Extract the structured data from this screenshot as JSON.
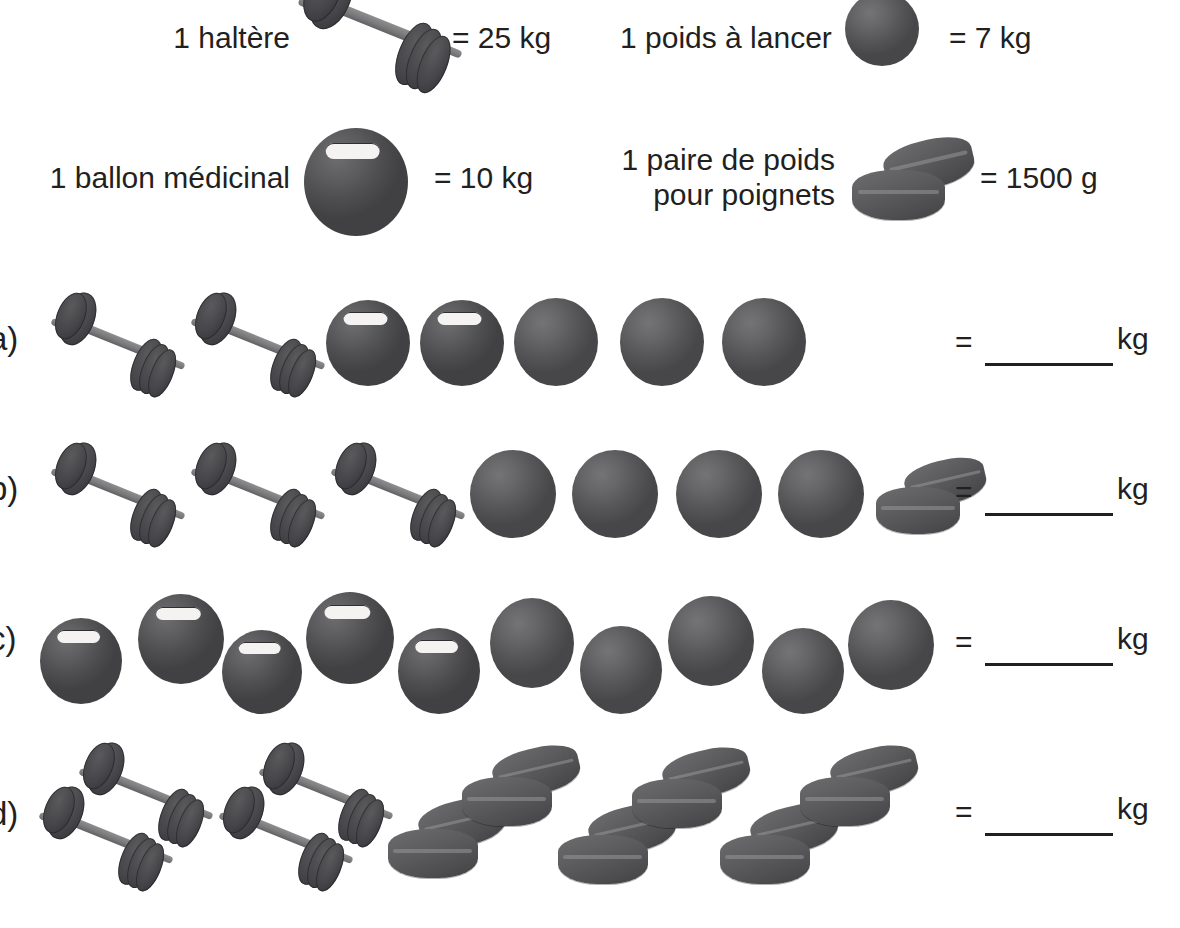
{
  "legend": {
    "items": [
      {
        "label": "1 haltère",
        "icon": "dumbbell-icon",
        "equals": "= 25 kg",
        "value": 25,
        "unit": "kg"
      },
      {
        "label": "1 poids à lancer",
        "icon": "shot-put-icon",
        "equals": "= 7 kg",
        "value": 7,
        "unit": "kg"
      },
      {
        "label": "1 ballon médicinal",
        "icon": "medicine-ball-icon",
        "equals": "= 10 kg",
        "value": 10,
        "unit": "kg"
      },
      {
        "label": "1 paire de poids\npour poignets",
        "icon": "wrist-weight-icon",
        "equals": "= 1500 g",
        "value": 1500,
        "unit": "g"
      }
    ]
  },
  "exercise": {
    "equals_sign": "=",
    "unit": "kg",
    "rows": [
      {
        "label": "a)",
        "items": [
          {
            "type": "dumbbell"
          },
          {
            "type": "dumbbell"
          },
          {
            "type": "medicine-ball"
          },
          {
            "type": "medicine-ball"
          },
          {
            "type": "shot-put"
          },
          {
            "type": "shot-put"
          },
          {
            "type": "shot-put"
          }
        ],
        "counts": {
          "dumbbell": 2,
          "medicine-ball": 2,
          "shot-put": 3,
          "wrist-weight": 0
        }
      },
      {
        "label": "b)",
        "items": [
          {
            "type": "dumbbell"
          },
          {
            "type": "dumbbell"
          },
          {
            "type": "dumbbell"
          },
          {
            "type": "shot-put"
          },
          {
            "type": "shot-put"
          },
          {
            "type": "shot-put"
          },
          {
            "type": "shot-put"
          },
          {
            "type": "wrist-weight"
          }
        ],
        "counts": {
          "dumbbell": 3,
          "medicine-ball": 0,
          "shot-put": 4,
          "wrist-weight": 1
        }
      },
      {
        "label": "c)",
        "items": [
          {
            "type": "medicine-ball"
          },
          {
            "type": "medicine-ball"
          },
          {
            "type": "medicine-ball"
          },
          {
            "type": "medicine-ball"
          },
          {
            "type": "medicine-ball"
          },
          {
            "type": "shot-put"
          },
          {
            "type": "shot-put"
          },
          {
            "type": "shot-put"
          },
          {
            "type": "shot-put"
          },
          {
            "type": "shot-put"
          }
        ],
        "counts": {
          "dumbbell": 0,
          "medicine-ball": 5,
          "shot-put": 5,
          "wrist-weight": 0
        }
      },
      {
        "label": "d)",
        "items": [
          {
            "type": "dumbbell"
          },
          {
            "type": "dumbbell"
          },
          {
            "type": "dumbbell"
          },
          {
            "type": "dumbbell"
          },
          {
            "type": "wrist-weight"
          },
          {
            "type": "wrist-weight"
          },
          {
            "type": "wrist-weight"
          },
          {
            "type": "wrist-weight"
          },
          {
            "type": "wrist-weight"
          },
          {
            "type": "wrist-weight"
          }
        ],
        "counts": {
          "dumbbell": 4,
          "medicine-ball": 0,
          "shot-put": 0,
          "wrist-weight": 6
        }
      }
    ]
  },
  "colors": {
    "ink": "#231f20",
    "equipment_dark": "#4e4e50",
    "equipment_mid": "#5d5d5f",
    "equipment_light": "#8e8e8f",
    "paper": "#ffffff"
  }
}
